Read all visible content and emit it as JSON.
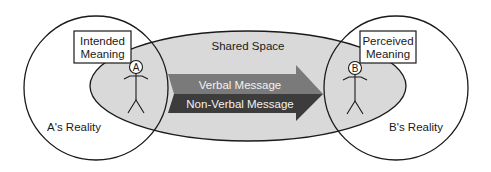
{
  "diagram": {
    "type": "communication-model",
    "shared_space": {
      "label": "Shared Space",
      "fill": "#d9d9d9"
    },
    "person_a": {
      "marker": "A",
      "reality_label": "A's Reality",
      "meaning_label_line1": "Intended",
      "meaning_label_line2": "Meaning"
    },
    "person_b": {
      "marker": "B",
      "reality_label": "B's Reality",
      "meaning_label_line1": "Perceived",
      "meaning_label_line2": "Meaning"
    },
    "arrow": {
      "upper_label": "Verbal Message",
      "lower_label": "Non-Verbal Message",
      "upper_color": "#7a7a7a",
      "lower_color": "#3c3c3c"
    },
    "colors": {
      "stroke": "#1a1a1a",
      "background": "#ffffff"
    }
  }
}
